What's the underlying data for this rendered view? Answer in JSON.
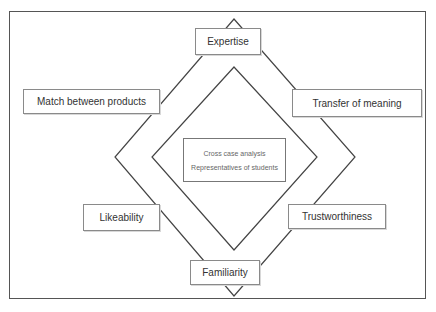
{
  "diagram": {
    "type": "concentric-diamond-framework",
    "outer_nodes": [
      {
        "id": "expertise",
        "label": "Expertise",
        "position": "top"
      },
      {
        "id": "transfer-of-meaning",
        "label": "Transfer of meaning",
        "position": "upper-right"
      },
      {
        "id": "trustworthiness",
        "label": "Trustworthiness",
        "position": "lower-right"
      },
      {
        "id": "familiarity",
        "label": "Familiarity",
        "position": "bottom"
      },
      {
        "id": "likeability",
        "label": "Likeability",
        "position": "lower-left"
      },
      {
        "id": "match-between-products",
        "label": "Match between products",
        "position": "upper-left"
      }
    ],
    "center": {
      "line1": "Cross case analysis",
      "line2": "Representatives of students"
    },
    "colors": {
      "line": "#444444",
      "box_border": "#8a8a8a",
      "text": "#333333",
      "center_text": "#666666",
      "background": "#ffffff"
    }
  }
}
